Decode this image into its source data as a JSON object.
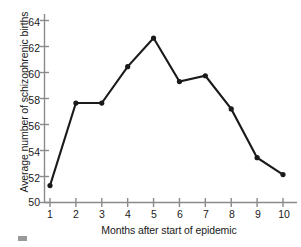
{
  "chart_data": {
    "type": "line",
    "title": "",
    "xlabel": "Months after start of epidemic",
    "ylabel": "Average number of schizophrenic births",
    "x": [
      1,
      2,
      3,
      4,
      5,
      6,
      7,
      8,
      9,
      10
    ],
    "values": [
      51.3,
      57.65,
      57.65,
      60.45,
      62.65,
      59.3,
      59.75,
      57.2,
      53.45,
      52.15
    ],
    "xtick_labels": [
      "1",
      "2",
      "3",
      "4",
      "5",
      "6",
      "7",
      "8",
      "9",
      "10"
    ],
    "ytick_labels": [
      "50",
      "52",
      "54",
      "56",
      "58",
      "60",
      "62",
      "64"
    ],
    "ytick_values": [
      50,
      52,
      54,
      56,
      58,
      60,
      62,
      64
    ],
    "xlim": [
      0.6,
      10.6
    ],
    "ylim": [
      50,
      65
    ],
    "grid": false,
    "legend": null,
    "marker": "filled-circle",
    "line_color": "#1a1a1a",
    "marker_color": "#1a1a1a",
    "axis_color": "#8a8a8a",
    "background_color": "#ffffff"
  }
}
